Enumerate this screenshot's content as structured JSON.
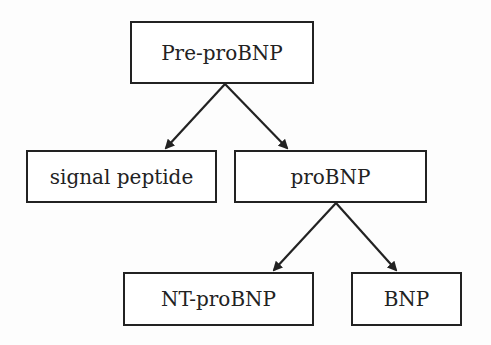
{
  "diagram": {
    "type": "hierarchy",
    "nodes": [
      {
        "id": "prepro",
        "label": "Pre-proBNP"
      },
      {
        "id": "signal",
        "label": "signal peptide"
      },
      {
        "id": "pro",
        "label": "proBNP"
      },
      {
        "id": "nt",
        "label": "NT-proBNP"
      },
      {
        "id": "bnp",
        "label": "BNP"
      }
    ],
    "edges": [
      {
        "from": "prepro",
        "to": "signal"
      },
      {
        "from": "prepro",
        "to": "pro"
      },
      {
        "from": "pro",
        "to": "nt"
      },
      {
        "from": "pro",
        "to": "bnp"
      }
    ],
    "colors": {
      "stroke": "#222222",
      "background": "#ffffff"
    }
  }
}
